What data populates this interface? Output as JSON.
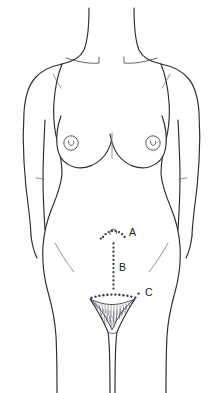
{
  "diagram": {
    "view": "anterior",
    "background_color": "#ffffff",
    "outline_color": "#2b2b30",
    "incision_marker_color": "#3b3b44",
    "label_color": "#17171c"
  },
  "labels": [
    {
      "id": "A",
      "text": "A",
      "name": "label-a",
      "x": 130,
      "y": 233,
      "marks": "periumbilical curved incision at the umbilicus"
    },
    {
      "id": "B",
      "text": "B",
      "name": "label-b",
      "x": 120,
      "y": 268,
      "marks": "vertical midline infraumbilical incision"
    },
    {
      "id": "C",
      "text": "C",
      "name": "label-c",
      "x": 146,
      "y": 294,
      "marks": "transverse suprapubic Pfannenstiel incision"
    }
  ],
  "incisions": {
    "a_periumbilical": {
      "type": "curved-dotted-arc",
      "dots": [
        [
          103,
          236
        ],
        [
          105.5,
          233.5
        ],
        [
          108.5,
          231.5
        ],
        [
          112,
          230.5
        ],
        [
          116,
          230.5
        ],
        [
          119.5,
          231.5
        ],
        [
          122.5,
          233.5
        ],
        [
          125,
          236
        ]
      ]
    },
    "b_midline_vertical": {
      "type": "vertical-dotted-line",
      "x": 113.5,
      "y_start": 243,
      "y_end": 289,
      "dots": [
        [
          113.5,
          243.5
        ],
        [
          113.5,
          247.5
        ],
        [
          113.5,
          251.5
        ],
        [
          113.5,
          255.5
        ],
        [
          113.5,
          259.5
        ],
        [
          113.5,
          263.5
        ],
        [
          113.5,
          267.5
        ],
        [
          113.5,
          271.5
        ],
        [
          113.5,
          275.5
        ],
        [
          113.5,
          279.5
        ],
        [
          113.5,
          283.5
        ],
        [
          113.5,
          287.5
        ]
      ]
    },
    "c_suprapubic_transverse": {
      "type": "curved-dotted-line",
      "dots": [
        [
          91.5,
          297.5
        ],
        [
          95.5,
          296.5
        ],
        [
          99.5,
          295.8
        ],
        [
          103.5,
          295.2
        ],
        [
          107.5,
          294.8
        ],
        [
          111.5,
          294.6
        ],
        [
          115.5,
          294.6
        ],
        [
          119.5,
          294.8
        ],
        [
          123.5,
          295.2
        ],
        [
          127.5,
          295.8
        ],
        [
          131.5,
          296.6
        ],
        [
          135.5,
          297.6
        ],
        [
          139.5,
          294.0
        ]
      ]
    }
  },
  "body_features": {
    "umbilicus": {
      "name": "umbilicus",
      "x": 113.5,
      "y": 233
    },
    "left_nipple": {
      "name": "nipple-left",
      "x": 71,
      "y": 143,
      "radius": 7
    },
    "right_nipple": {
      "name": "nipple-right",
      "x": 153,
      "y": 143,
      "radius": 7
    },
    "pubic_region": {
      "name": "pubic-region",
      "label": "mons pubis"
    },
    "clavicles": {
      "name": "clavicle-lines",
      "count": 2
    },
    "breasts": {
      "name": "breast-contours",
      "count": 2
    },
    "hip_creases": {
      "name": "hip-crease-lines",
      "count": 2
    },
    "arms": {
      "name": "arms",
      "count": 2
    },
    "legs": {
      "name": "legs",
      "count": 2
    }
  }
}
